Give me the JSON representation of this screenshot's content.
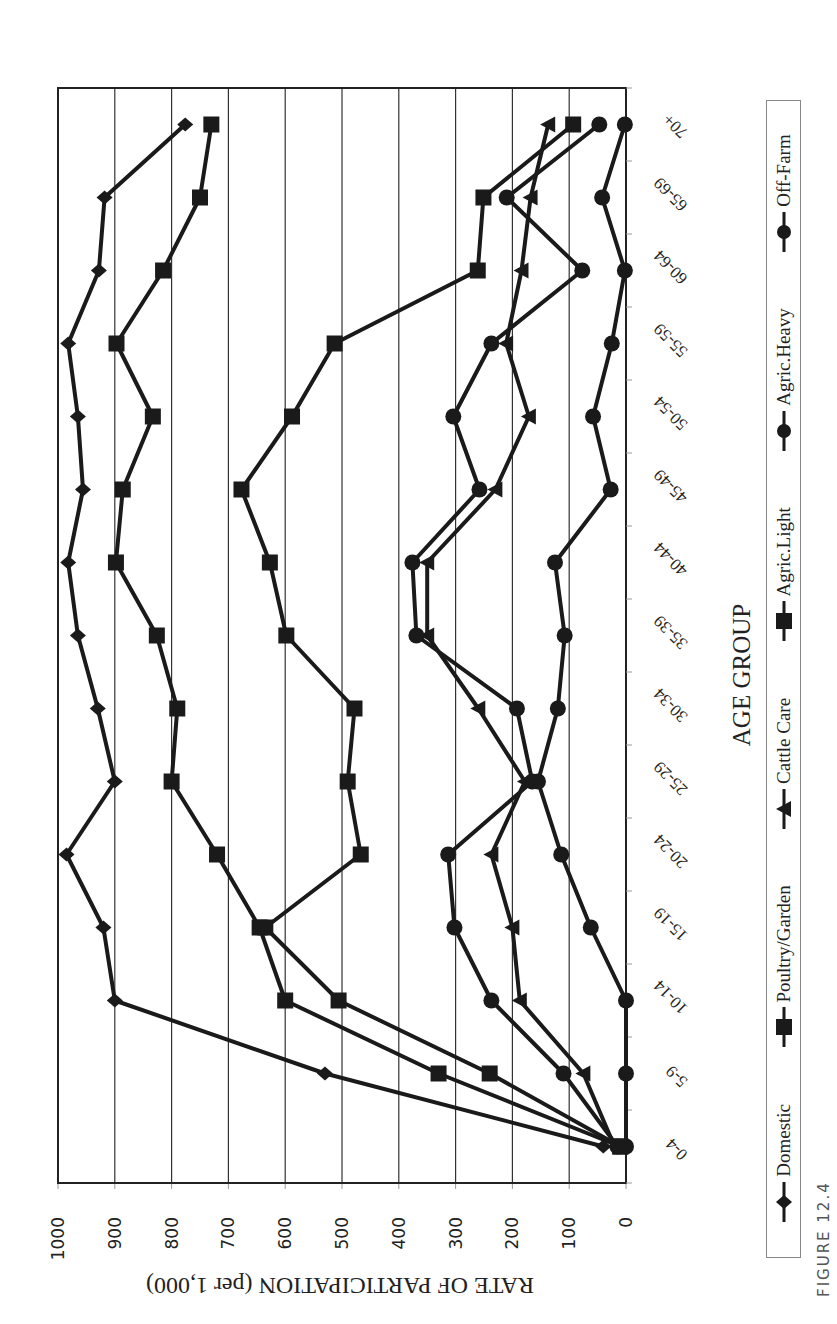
{
  "figure": {
    "caption": "FIGURE 12.4"
  },
  "chart_data": {
    "type": "line",
    "title": "",
    "xlabel": "AGE GROUP",
    "ylabel": "RATE OF PARTICIPATION (per 1,000)",
    "ylim": [
      0,
      1000
    ],
    "yticks": [
      "1000",
      "900",
      "800",
      "700",
      "600",
      "500",
      "400",
      "300",
      "200",
      "100",
      "0"
    ],
    "grid": "horizontal major gridlines every 100",
    "legend_position": "bottom",
    "orientation_note": "figure rendered rotated 90° counterclockwise on page",
    "categories": [
      "0-4",
      "5-9",
      "10-14",
      "15-19",
      "20-24",
      "25-29",
      "30-34",
      "35-39",
      "40-44",
      "45-49",
      "50-54",
      "55-59",
      "60-64",
      "65-69",
      "70+"
    ],
    "series": [
      {
        "name": "Domestic",
        "marker": "diamond",
        "values": [
          40,
          530,
          900,
          920,
          985,
          900,
          930,
          965,
          982,
          956,
          965,
          982,
          928,
          918,
          776
        ]
      },
      {
        "name": "Poultry/Garden",
        "marker": "square",
        "values": [
          10,
          330,
          600,
          645,
          720,
          800,
          790,
          826,
          898,
          886,
          833,
          897,
          815,
          750,
          730
        ]
      },
      {
        "name": "Cattle Care",
        "marker": "triangle",
        "values": [
          20,
          75,
          187,
          200,
          237,
          178,
          260,
          350,
          350,
          230,
          171,
          211,
          184,
          168,
          137
        ]
      },
      {
        "name": "Agric.Light",
        "marker": "square",
        "values": [
          10,
          240,
          506,
          635,
          467,
          490,
          478,
          598,
          627,
          677,
          588,
          513,
          261,
          251,
          93
        ]
      },
      {
        "name": "Agric.Heavy",
        "marker": "circle",
        "values": [
          15,
          110,
          237,
          302,
          313,
          165,
          192,
          369,
          376,
          258,
          304,
          237,
          77,
          210,
          47
        ]
      },
      {
        "name": "Off-Farm",
        "marker": "circle",
        "values": [
          0,
          0,
          0,
          62,
          114,
          155,
          120,
          108,
          125,
          27,
          58,
          25,
          2,
          42,
          2
        ]
      }
    ]
  },
  "style": {
    "line_color": "#1a1a1a",
    "grid_color": "#333333",
    "legend_border": "#888888"
  }
}
